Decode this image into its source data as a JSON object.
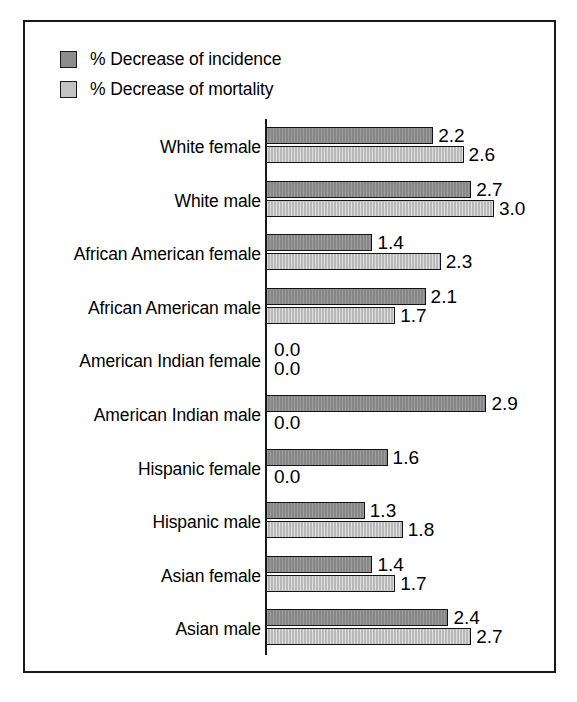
{
  "figure": {
    "frame_color": "#1a1a1a",
    "background": "#ffffff"
  },
  "legend": {
    "position": "top-left",
    "items": [
      {
        "label": "% Decrease of incidence",
        "color": "#8d8d8d",
        "swatch_name": "legend-swatch-incidence"
      },
      {
        "label": "% Decrease of mortality",
        "color": "#c2c2c2",
        "swatch_name": "legend-swatch-mortality"
      }
    ]
  },
  "chart_data": {
    "type": "bar",
    "orientation": "horizontal",
    "title": "",
    "subtitle": "",
    "xlabel": "",
    "ylabel": "",
    "xlim": [
      0,
      3.0
    ],
    "grid": false,
    "legend_position": "top-left",
    "categories": [
      "White female",
      "White male",
      "African American female",
      "African American male",
      "American Indian female",
      "American Indian male",
      "Hispanic female",
      "Hispanic male",
      "Asian female",
      "Asian male"
    ],
    "series": [
      {
        "name": "% Decrease of incidence",
        "color": "#8d8d8d",
        "values": [
          2.2,
          2.7,
          1.4,
          2.1,
          0.0,
          2.9,
          1.6,
          1.3,
          1.4,
          2.4
        ],
        "labels": [
          "2.2",
          "2.7",
          "1.4",
          "2.1",
          "0.0",
          "2.9",
          "1.6",
          "1.3",
          "1.4",
          "2.4"
        ]
      },
      {
        "name": "% Decrease of mortality",
        "color": "#c2c2c2",
        "values": [
          2.6,
          3.0,
          2.3,
          1.7,
          0.0,
          0.0,
          0.0,
          1.8,
          1.7,
          2.7
        ],
        "labels": [
          "2.6",
          "3.0",
          "2.3",
          "1.7",
          "0.0",
          "0.0",
          "0.0",
          "1.8",
          "1.7",
          "2.7"
        ]
      }
    ]
  }
}
